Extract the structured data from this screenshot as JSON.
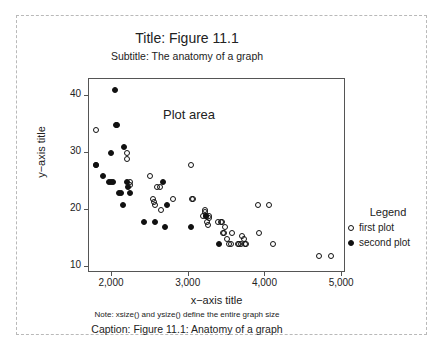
{
  "figure": {
    "title": "Title: Figure 11.1",
    "subtitle": "Subtitle: The anatomy of a graph",
    "plot_area_label": "Plot area",
    "note": "Note: xsize() and ysize() define the entire graph size",
    "caption": "Caption: Figure 11.1: Anatomy of a graph"
  },
  "legend": {
    "title": "Legend",
    "entries": [
      {
        "label": "first plot",
        "marker": "open-circle"
      },
      {
        "label": "second plot",
        "marker": "filled-circle"
      }
    ]
  },
  "chart_data": {
    "type": "scatter",
    "title": "Title: Figure 11.1",
    "subtitle": "Subtitle: The anatomy of a graph",
    "xlabel": "x−axis title",
    "ylabel": "y−axis title",
    "xlim": [
      1700,
      5050
    ],
    "ylim": [
      9,
      43
    ],
    "xticks": [
      2000,
      3000,
      4000,
      5000
    ],
    "xticklabels": [
      "2,000",
      "3,000",
      "4,000",
      "5,000"
    ],
    "yticks": [
      10,
      20,
      30,
      40
    ],
    "yticklabels": [
      "10",
      "20",
      "30",
      "40"
    ],
    "grid": false,
    "legend_position": "right",
    "annotations": [
      {
        "text": "Plot area",
        "x": 3050,
        "y": 36
      }
    ],
    "series": [
      {
        "name": "first plot",
        "marker": "open-circle",
        "points": [
          [
            1790,
            34
          ],
          [
            1785,
            28
          ],
          [
            2190,
            30
          ],
          [
            2195,
            29
          ],
          [
            2230,
            25
          ],
          [
            2240,
            24.5
          ],
          [
            2500,
            26
          ],
          [
            2590,
            24
          ],
          [
            2620,
            24
          ],
          [
            2540,
            22
          ],
          [
            2545,
            21.5
          ],
          [
            2560,
            21
          ],
          [
            2640,
            20
          ],
          [
            2790,
            22
          ],
          [
            3030,
            28
          ],
          [
            3040,
            22
          ],
          [
            3060,
            22
          ],
          [
            3210,
            20
          ],
          [
            3215,
            19.7
          ],
          [
            3190,
            19
          ],
          [
            3230,
            19
          ],
          [
            3260,
            19
          ],
          [
            3270,
            18.7
          ],
          [
            3240,
            18
          ],
          [
            3250,
            17.5
          ],
          [
            3380,
            18
          ],
          [
            3420,
            18
          ],
          [
            3430,
            18
          ],
          [
            3470,
            17
          ],
          [
            3450,
            16
          ],
          [
            3460,
            16
          ],
          [
            3500,
            15
          ],
          [
            3560,
            16
          ],
          [
            3520,
            14
          ],
          [
            3545,
            14
          ],
          [
            3640,
            14
          ],
          [
            3660,
            14
          ],
          [
            3680,
            14
          ],
          [
            3700,
            15.5
          ],
          [
            3720,
            15
          ],
          [
            3730,
            14
          ],
          [
            3750,
            14
          ],
          [
            3900,
            21
          ],
          [
            3910,
            16
          ],
          [
            4050,
            21
          ],
          [
            4100,
            14
          ],
          [
            4700,
            12
          ],
          [
            4850,
            12
          ]
        ]
      },
      {
        "name": "second plot",
        "marker": "filled-circle",
        "points": [
          [
            2040,
            41
          ],
          [
            2050,
            35
          ],
          [
            2060,
            35
          ],
          [
            1990,
            30
          ],
          [
            2160,
            31
          ],
          [
            1880,
            26
          ],
          [
            1790,
            28
          ],
          [
            1960,
            25
          ],
          [
            1985,
            25
          ],
          [
            2010,
            25
          ],
          [
            2190,
            25
          ],
          [
            2210,
            24
          ],
          [
            2090,
            23
          ],
          [
            2120,
            23
          ],
          [
            2230,
            23
          ],
          [
            2140,
            21
          ],
          [
            2670,
            25
          ],
          [
            2720,
            21
          ],
          [
            2420,
            18
          ],
          [
            2560,
            18
          ],
          [
            2690,
            17
          ],
          [
            3030,
            17
          ],
          [
            3220,
            19
          ],
          [
            3400,
            14
          ]
        ]
      }
    ]
  }
}
